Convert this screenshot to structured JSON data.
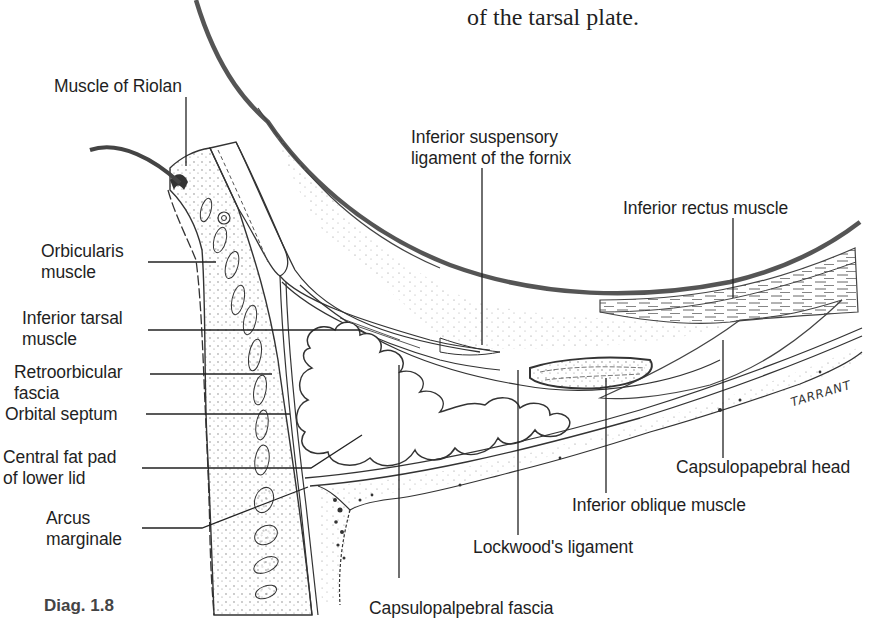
{
  "caption_fragment": "of the tarsal plate.",
  "figure_label": "Diag. 1.8",
  "artist_signature": "TARRANT",
  "labels": {
    "muscle_of_riolan": "Muscle of Riolan",
    "inferior_suspensory_ligament_line1": "Inferior suspensory",
    "inferior_suspensory_ligament_line2": "ligament of the fornix",
    "inferior_rectus_muscle": "Inferior rectus muscle",
    "orbicularis_line1": "Orbicularis",
    "orbicularis_line2": "muscle",
    "inferior_tarsal_line1": "Inferior tarsal",
    "inferior_tarsal_line2": "muscle",
    "retroorbicular_line1": "Retroorbicular",
    "retroorbicular_line2": "fascia",
    "orbital_septum": "Orbital septum",
    "central_fat_pad_line1": "Central fat pad",
    "central_fat_pad_line2": "of lower lid",
    "arcus_marginale_line1": "Arcus",
    "arcus_marginale_line2": "marginale",
    "capsulopalpebral_head": "Capsulopapebral head",
    "inferior_oblique_muscle": "Inferior oblique muscle",
    "lockwoods_ligament": "Lockwood's ligament",
    "capsulopalpebral_fascia": "Capsulopalpebral fascia"
  },
  "colors": {
    "ink": "#2a2a2a",
    "globe_outline": "#4a4a4a",
    "background": "#ffffff"
  }
}
